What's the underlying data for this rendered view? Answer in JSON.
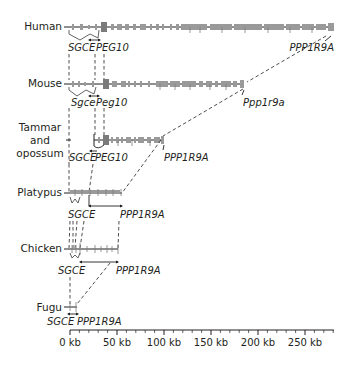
{
  "figure": {
    "species": [
      {
        "label": "Human",
        "genes": [
          "SGCE",
          "PEG10",
          "PPP1R9A"
        ]
      },
      {
        "label": "Mouse",
        "genes": [
          "Sgce",
          "Peg10",
          "Ppp1r9a"
        ]
      },
      {
        "label_lines": [
          "Tammar",
          "and",
          "opossum"
        ],
        "genes": [
          "SGCE",
          "PEG10",
          "PPP1R9A"
        ]
      },
      {
        "label": "Platypus",
        "genes": [
          "SGCE",
          "PPP1R9A"
        ]
      },
      {
        "label": "Chicken",
        "genes": [
          "SGCE",
          "PPP1R9A"
        ]
      },
      {
        "label": "Fugu",
        "genes": [
          "SGCE",
          "PPP1R9A"
        ]
      }
    ],
    "scale_bar": {
      "unit": "kb",
      "ticks": [
        "0 kb",
        "50 kb",
        "100 kb",
        "150 kb",
        "200 kb",
        "250 kb"
      ],
      "values": [
        0,
        50,
        100,
        150,
        200,
        250
      ],
      "max_kb": 280,
      "minor_step_kb": 10
    },
    "colors": {
      "line": "#231f20",
      "exon": "#9a9a9a"
    }
  }
}
